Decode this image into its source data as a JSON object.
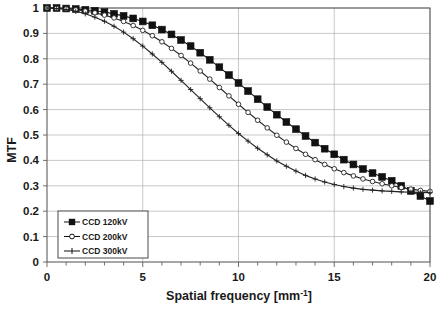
{
  "chart_data": {
    "type": "line",
    "title": "",
    "xlabel": "Spatial frequency [mm-1]",
    "xlabel_base": "Spatial frequency [mm",
    "xlabel_sup": "-1",
    "xlabel_tail": "]",
    "ylabel": "MTF",
    "xlim": [
      0,
      20
    ],
    "ylim": [
      0,
      1
    ],
    "xticks": [
      0,
      5,
      10,
      15,
      20
    ],
    "xtick_labels": [
      "0",
      "5",
      "10",
      "15",
      "20"
    ],
    "xminor_step": 1,
    "yticks": [
      0,
      0.1,
      0.2,
      0.3,
      0.4,
      0.5,
      0.6,
      0.7,
      0.8,
      0.9,
      1
    ],
    "ytick_labels": [
      "0",
      "0.1",
      "0.2",
      "0.3",
      "0.4",
      "0.5",
      "0.6",
      "0.7",
      "0.8",
      "0.9",
      "1"
    ],
    "grid": true,
    "grid_color": "#b0b0b0",
    "axis_color": "#606060",
    "legend_position": "lower-left",
    "series": [
      {
        "name": "CCD 120kV",
        "marker": "filled-square",
        "color": "#111111",
        "x": [
          0,
          0.5,
          1,
          1.5,
          2,
          2.5,
          3,
          3.5,
          4,
          4.5,
          5,
          5.5,
          6,
          6.5,
          7,
          7.5,
          8,
          8.5,
          9,
          9.5,
          10,
          10.5,
          11,
          11.5,
          12,
          12.5,
          13,
          13.5,
          14,
          14.5,
          15,
          15.5,
          16,
          16.5,
          17,
          17.5,
          18,
          18.5,
          19,
          19.5,
          20
        ],
        "values": [
          1.0,
          1.0,
          0.998,
          0.996,
          0.993,
          0.989,
          0.984,
          0.977,
          0.969,
          0.959,
          0.947,
          0.932,
          0.915,
          0.896,
          0.874,
          0.85,
          0.824,
          0.796,
          0.767,
          0.736,
          0.705,
          0.673,
          0.641,
          0.61,
          0.58,
          0.551,
          0.523,
          0.496,
          0.47,
          0.446,
          0.424,
          0.403,
          0.384,
          0.366,
          0.35,
          0.335,
          0.32,
          0.3,
          0.28,
          0.26,
          0.24
        ]
      },
      {
        "name": "CCD 200kV",
        "marker": "open-circle",
        "color": "#222222",
        "x": [
          0,
          0.5,
          1,
          1.5,
          2,
          2.5,
          3,
          3.5,
          4,
          4.5,
          5,
          5.5,
          6,
          6.5,
          7,
          7.5,
          8,
          8.5,
          9,
          9.5,
          10,
          10.5,
          11,
          11.5,
          12,
          12.5,
          13,
          13.5,
          14,
          14.5,
          15,
          15.5,
          16,
          16.5,
          17,
          17.5,
          18,
          18.5,
          19,
          19.5,
          20
        ],
        "values": [
          1.0,
          0.999,
          0.997,
          0.993,
          0.988,
          0.981,
          0.972,
          0.961,
          0.947,
          0.931,
          0.912,
          0.891,
          0.867,
          0.841,
          0.813,
          0.783,
          0.752,
          0.72,
          0.687,
          0.654,
          0.621,
          0.589,
          0.558,
          0.528,
          0.499,
          0.472,
          0.447,
          0.424,
          0.403,
          0.384,
          0.367,
          0.352,
          0.339,
          0.327,
          0.317,
          0.308,
          0.3,
          0.293,
          0.287,
          0.282,
          0.278
        ]
      },
      {
        "name": "CCD 300kV",
        "marker": "plus",
        "color": "#222222",
        "x": [
          0,
          0.5,
          1,
          1.5,
          2,
          2.5,
          3,
          3.5,
          4,
          4.5,
          5,
          5.5,
          6,
          6.5,
          7,
          7.5,
          8,
          8.5,
          9,
          9.5,
          10,
          10.5,
          11,
          11.5,
          12,
          12.5,
          13,
          13.5,
          14,
          14.5,
          15,
          15.5,
          16,
          16.5,
          17,
          17.5,
          18,
          18.5,
          19,
          19.5,
          20
        ],
        "values": [
          1.0,
          0.998,
          0.994,
          0.987,
          0.977,
          0.964,
          0.948,
          0.928,
          0.905,
          0.879,
          0.85,
          0.819,
          0.786,
          0.751,
          0.715,
          0.679,
          0.643,
          0.607,
          0.572,
          0.538,
          0.506,
          0.476,
          0.448,
          0.422,
          0.398,
          0.377,
          0.358,
          0.341,
          0.327,
          0.315,
          0.305,
          0.297,
          0.291,
          0.286,
          0.283,
          0.28,
          0.278,
          0.276,
          0.275,
          0.274,
          0.273
        ]
      }
    ]
  },
  "legend": {
    "items": [
      {
        "label": "CCD 120kV",
        "marker": "filled-square"
      },
      {
        "label": "CCD 200kV",
        "marker": "open-circle"
      },
      {
        "label": "CCD 300kV",
        "marker": "plus"
      }
    ]
  }
}
